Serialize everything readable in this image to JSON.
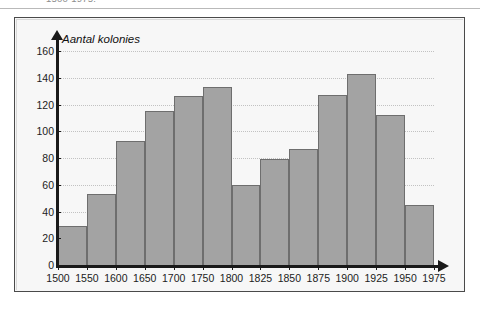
{
  "caption": {
    "text": "1500-1975."
  },
  "chart_data": {
    "type": "bar",
    "title": "",
    "xlabel": "",
    "ylabel": "Aantal kolonies",
    "ylim": [
      0,
      160
    ],
    "yticks": [
      0,
      20,
      40,
      60,
      80,
      100,
      120,
      140,
      160
    ],
    "xticks": [
      "1500",
      "1550",
      "1600",
      "1650",
      "1700",
      "1750",
      "1800",
      "1825",
      "1850",
      "1875",
      "1900",
      "1925",
      "1950",
      "1975"
    ],
    "categories": [
      "1500",
      "1550",
      "1600",
      "1650",
      "1700",
      "1750",
      "1800",
      "1825",
      "1850",
      "1875",
      "1900",
      "1925",
      "1950"
    ],
    "values": [
      29,
      53,
      93,
      115,
      126,
      133,
      60,
      79,
      87,
      127,
      143,
      112,
      45
    ],
    "grid": true,
    "legend": "none",
    "colors": {
      "bar_fill": "#a3a3a3",
      "bar_border": "#6e6e6e",
      "axis": "#1a1a1a",
      "gridline": "#c2c2c2",
      "frame": "#4a4a4a",
      "background": "#f7f7f7"
    }
  }
}
